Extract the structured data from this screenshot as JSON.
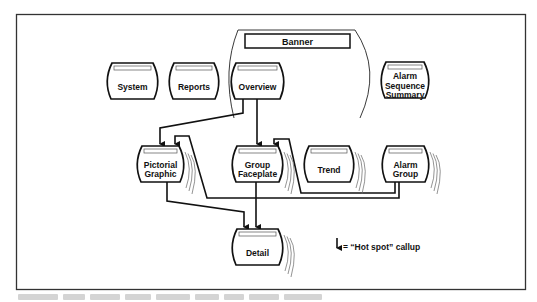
{
  "diagram": {
    "banner": {
      "label": "Banner"
    },
    "nodes": [
      {
        "id": "system",
        "lines": [
          "System"
        ]
      },
      {
        "id": "reports",
        "lines": [
          "Reports"
        ]
      },
      {
        "id": "overview",
        "lines": [
          "Overview"
        ]
      },
      {
        "id": "alarm-sequence-summary",
        "lines": [
          "Alarm",
          "Sequence",
          "Summary"
        ]
      },
      {
        "id": "pictorial-graphic",
        "lines": [
          "Pictorial",
          "Graphic"
        ]
      },
      {
        "id": "group-faceplate",
        "lines": [
          "Group",
          "Faceplate"
        ]
      },
      {
        "id": "trend",
        "lines": [
          "Trend"
        ]
      },
      {
        "id": "alarm-group",
        "lines": [
          "Alarm",
          "Group"
        ]
      },
      {
        "id": "detail",
        "lines": [
          "Detail"
        ]
      }
    ],
    "edges": [
      {
        "from": "overview",
        "to": "pictorial-graphic"
      },
      {
        "from": "overview",
        "to": "group-faceplate"
      },
      {
        "from": "pictorial-graphic",
        "to": "detail"
      },
      {
        "from": "group-faceplate",
        "to": "detail"
      },
      {
        "from": "alarm-group",
        "to": "pictorial-graphic"
      },
      {
        "from": "alarm-group",
        "to": "group-faceplate"
      }
    ],
    "legend": {
      "symbol": "down-arrow",
      "label": "= “Hot spot” callup"
    }
  },
  "colors": {
    "line": "#111111",
    "frame": "#333333",
    "header_bar": "#ffffff",
    "background": "#ffffff"
  }
}
